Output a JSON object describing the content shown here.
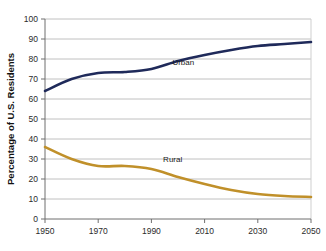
{
  "chart_data": {
    "type": "line",
    "title": "",
    "xlabel": "",
    "ylabel": "Percentage of U.S. Residents",
    "xlim": [
      1950,
      2050
    ],
    "ylim": [
      0,
      100
    ],
    "grid": true,
    "legend_position": "inline-labels",
    "x_ticks": [
      "1950",
      "1970",
      "1990",
      "2010",
      "2030",
      "2050"
    ],
    "x_tick_values": [
      1950,
      1970,
      1990,
      2010,
      2030,
      2050
    ],
    "y_ticks": [
      "0",
      "10",
      "20",
      "30",
      "40",
      "50",
      "60",
      "70",
      "80",
      "90",
      "100"
    ],
    "y_tick_values": [
      0,
      10,
      20,
      30,
      40,
      50,
      60,
      70,
      80,
      90,
      100
    ],
    "x": [
      1950,
      1960,
      1970,
      1980,
      1990,
      2000,
      2010,
      2020,
      2030,
      2040,
      2050
    ],
    "series": [
      {
        "name": "Urban",
        "color": "#1f2a5a",
        "label_x": 2002,
        "label_y": 77,
        "values": [
          64,
          70,
          73,
          73.5,
          75,
          79,
          82,
          84.5,
          86.5,
          87.5,
          88.5
        ]
      },
      {
        "name": "Rural",
        "color": "#c0902a",
        "label_x": 1998,
        "label_y": 28.5,
        "values": [
          36,
          30,
          26.5,
          26.5,
          25,
          21,
          17.5,
          14.5,
          12.5,
          11.5,
          11
        ]
      }
    ]
  },
  "colors": {
    "urban_line": "#1f2a5a",
    "rural_line": "#c0902a",
    "gridline": "#b9b9b9",
    "axis": "#6f6f6f",
    "text": "#1a1a1a",
    "background": "#ffffff"
  },
  "labels": {
    "y_axis_title": "Percentage of U.S. Residents",
    "urban_label": "Urban",
    "rural_label": "Rural"
  }
}
